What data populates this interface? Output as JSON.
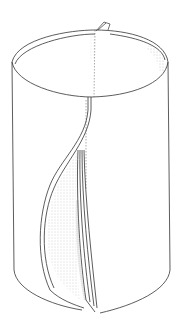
{
  "figure": {
    "colors": {
      "background": "#ffffff",
      "stroke": "#333333",
      "shading": "#9a9a9a"
    }
  }
}
